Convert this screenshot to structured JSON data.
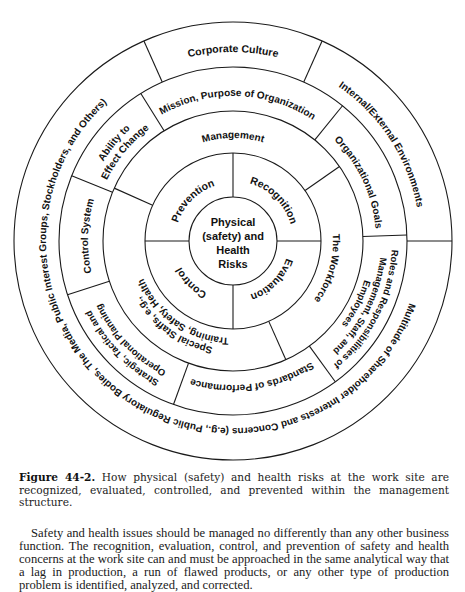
{
  "figure": {
    "center_label": [
      "Physical",
      "(safety) and",
      "Health",
      "Risks"
    ],
    "ring1_quadrants": {
      "prevention": "Prevention",
      "recognition": "Recognition",
      "evaluation": "Evaluation",
      "control": "Control"
    },
    "ring2": {
      "management": "Management",
      "workforce": "The Workforce",
      "special_staffs_line1": "Special Staffs, e.g.,",
      "special_staffs_line2": "Training, Safety, Health"
    },
    "ring3": {
      "mission": "Mission, Purpose of Organization",
      "org_goals": "Organizational Goals",
      "roles_line1": "Roles and Responsibilities of",
      "roles_line2": "Management, Staff, and",
      "roles_line3": "Employees",
      "standards": "Standards of Performance",
      "planning_line1": "Strategic, Tactical and",
      "planning_line2": "Operational Planning",
      "control_system": "Control System",
      "ability_line1": "Ability to",
      "ability_line2": "Effect Change"
    },
    "outer_ring": {
      "corporate_culture": "Corporate Culture",
      "internal_external": "Internal/External Environments",
      "stakeholders": "Multitude of Shareholder Interests and Concerns (e.g., Public Regulatory Bodies, The Media, Public Interest Groups, Stockholders, and Others)"
    },
    "colors": {
      "line": "#1a1a1a",
      "text": "#111111",
      "background": "#ffffff"
    }
  },
  "caption": {
    "label": "Figure 44-2.",
    "text": "How physical (safety) and health risks at the work site are recognized, evaluated, controlled, and prevented within the management structure."
  },
  "body": {
    "paragraph": "Safety and health issues should be managed no differently than any other business function. The recognition, evaluation, control, and prevention of safety and health concerns at the work site can and must be approached in the same analytical way that a lag in production, a run of flawed products, or any other type of production problem is identified, analyzed, and corrected."
  }
}
